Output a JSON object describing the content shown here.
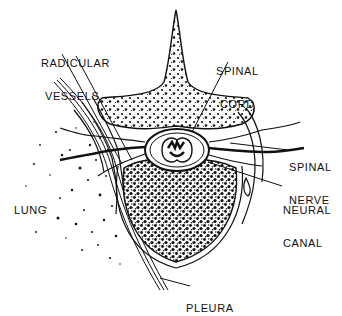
{
  "diagram": {
    "type": "anatomical cross-section",
    "colors": {
      "ink": "#111111",
      "background": "#ffffff"
    },
    "labels": {
      "radicular_vessels": {
        "line1": "RADICULAR",
        "line2": "VESSELS"
      },
      "spinal_cord": {
        "line1": "SPINAL",
        "line2": "CORD"
      },
      "spinal_nerve": {
        "line1": "SPINAL",
        "line2": "NERVE"
      },
      "neural_canal": {
        "line1": "NEURAL",
        "line2": "CANAL"
      },
      "lung": {
        "line1": "LUNG"
      },
      "pleura": {
        "line1": "PLEURA"
      }
    }
  }
}
